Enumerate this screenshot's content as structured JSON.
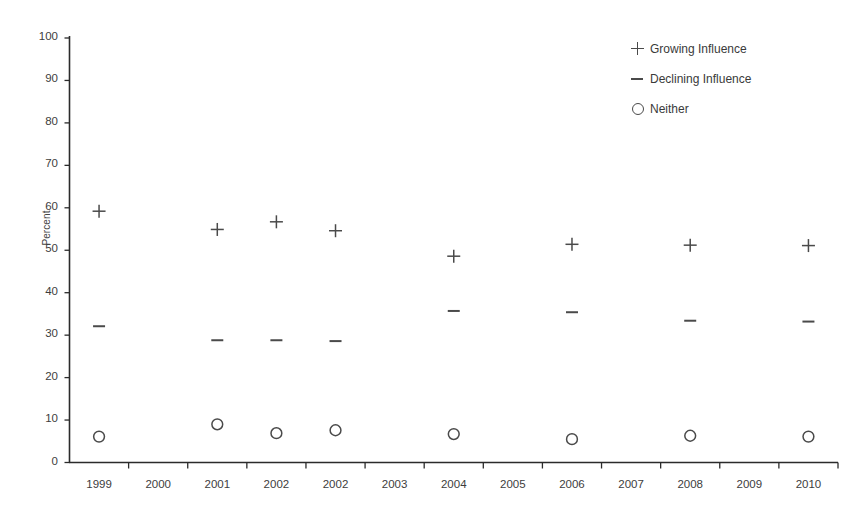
{
  "chart_data": {
    "type": "scatter",
    "title": "",
    "xlabel": "",
    "ylabel": "Percent",
    "ylim": [
      0,
      100
    ],
    "ytick_step": 10,
    "yticks": [
      "100",
      "90",
      "80",
      "70",
      "60",
      "50",
      "40",
      "30",
      "20",
      "10",
      "0"
    ],
    "categories": [
      "1999",
      "2000",
      "2001",
      "2002",
      "2002",
      "2003",
      "2004",
      "2005",
      "2006",
      "2007",
      "2008",
      "2009",
      "2010"
    ],
    "grid": false,
    "legend_position": "top-right",
    "series": [
      {
        "name": "Growing Influence",
        "marker": "plus",
        "points": [
          {
            "category": "1999",
            "value": 59.2
          },
          {
            "category": "2001",
            "value": 54.9
          },
          {
            "category": "2002",
            "value": 56.7
          },
          {
            "category": "2002",
            "value": 54.6
          },
          {
            "category": "2004",
            "value": 48.6
          },
          {
            "category": "2006",
            "value": 51.4
          },
          {
            "category": "2008",
            "value": 51.2
          },
          {
            "category": "2010",
            "value": 51.1
          }
        ]
      },
      {
        "name": "Declining Influence",
        "marker": "minus",
        "points": [
          {
            "category": "1999",
            "value": 32.1
          },
          {
            "category": "2001",
            "value": 28.8
          },
          {
            "category": "2002",
            "value": 28.8
          },
          {
            "category": "2002",
            "value": 28.6
          },
          {
            "category": "2004",
            "value": 35.7
          },
          {
            "category": "2006",
            "value": 35.4
          },
          {
            "category": "2008",
            "value": 33.4
          },
          {
            "category": "2010",
            "value": 33.2
          }
        ]
      },
      {
        "name": "Neither",
        "marker": "circle",
        "points": [
          {
            "category": "1999",
            "value": 6.1
          },
          {
            "category": "2001",
            "value": 9.0
          },
          {
            "category": "2002",
            "value": 6.9
          },
          {
            "category": "2002",
            "value": 7.6
          },
          {
            "category": "2004",
            "value": 6.7
          },
          {
            "category": "2006",
            "value": 5.5
          },
          {
            "category": "2008",
            "value": 6.3
          },
          {
            "category": "2010",
            "value": 6.1
          }
        ]
      }
    ]
  },
  "legend": {
    "items": [
      {
        "label": "Growing Influence",
        "marker": "plus"
      },
      {
        "label": "Declining Influence",
        "marker": "minus"
      },
      {
        "label": "Neither",
        "marker": "circle"
      }
    ]
  },
  "colors": {
    "marker": "#4a4a4a",
    "axis": "#2b2b2b",
    "text": "#3a3a3a",
    "background": "#ffffff"
  }
}
